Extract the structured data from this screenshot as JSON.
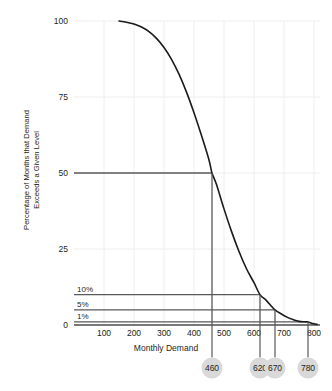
{
  "chart_data": {
    "type": "line",
    "title": "",
    "xlabel": "Monthly Demand",
    "ylabel_line1": "Percentage of Months that Demand",
    "ylabel_line2": "Exceeds a Given Level",
    "xlim": [
      0,
      820
    ],
    "ylim": [
      0,
      100
    ],
    "grid": true,
    "legend": "none",
    "xticks": [
      100,
      200,
      300,
      400,
      500,
      600,
      700,
      800
    ],
    "xticklabels": [
      "100",
      "200",
      "300",
      "400",
      "500",
      "600",
      "700",
      "800"
    ],
    "yticks": [
      0,
      25,
      50,
      75,
      100
    ],
    "yticklabels": [
      "0",
      "25",
      "50",
      "75",
      "100"
    ],
    "series": [
      {
        "name": "Exceedance curve",
        "x": [
          150,
          175,
          200,
          225,
          250,
          275,
          300,
          325,
          350,
          375,
          400,
          425,
          450,
          460,
          475,
          500,
          525,
          550,
          575,
          600,
          620,
          640,
          660,
          670,
          690,
          710,
          730,
          750,
          770,
          780,
          795,
          810
        ],
        "y": [
          100,
          99.6,
          99,
          98,
          96.5,
          94.3,
          91.3,
          87.4,
          82.5,
          76.6,
          69.8,
          62.3,
          54.3,
          50.0,
          46.2,
          38.2,
          30.8,
          24.2,
          18.5,
          13.9,
          10.0,
          8.2,
          6.0,
          5.0,
          3.7,
          2.6,
          1.8,
          1.2,
          1.05,
          1.0,
          0.5,
          0.2
        ]
      }
    ],
    "reference_lines": [
      {
        "label": "50",
        "level": 50,
        "demand": 460,
        "label_kind": "ytick"
      },
      {
        "label": "10%",
        "level": 10,
        "demand": 620,
        "label_kind": "pct"
      },
      {
        "label": "5%",
        "level": 5,
        "demand": 670,
        "label_kind": "pct"
      },
      {
        "label": "1%",
        "level": 1,
        "demand": 780,
        "label_kind": "pct"
      }
    ],
    "callouts": [
      {
        "value": "460",
        "demand": 460
      },
      {
        "value": "620",
        "demand": 620
      },
      {
        "value": "670",
        "demand": 670
      },
      {
        "value": "780",
        "demand": 780
      }
    ],
    "colors": {
      "curve": "#1a1a1a",
      "axis": "#4d4d4d",
      "gridline": "#eeeeee",
      "reference_line": "#595959",
      "callout_fill": "#d9d9d9",
      "callout_text": "#231f20",
      "text": "#231f20",
      "background": "#ffffff"
    }
  }
}
